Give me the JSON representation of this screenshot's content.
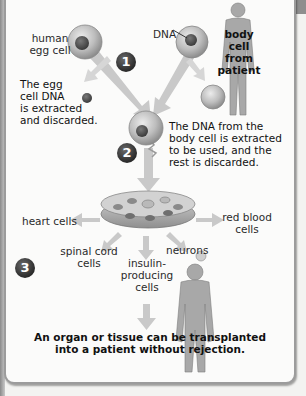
{
  "labels": {
    "human_egg_cell": [
      "human",
      "egg cell"
    ],
    "dna": "DNA",
    "body_cell": [
      "body cell",
      "from",
      "patient"
    ],
    "egg_dna_discarded": [
      "The egg",
      "cell DNA",
      "is extracted",
      "and discarded."
    ],
    "body_dna_extracted": [
      "The DNA from the",
      "body cell is extracted",
      "to be used, and the",
      "rest is discarded."
    ],
    "heart_cells": "heart cells",
    "red_blood_cells": [
      "red blood",
      "cells"
    ],
    "spinal_cord_cells": [
      "spinal cord",
      "cells"
    ],
    "insulin_cells": [
      "insulin-",
      "producing",
      "cells"
    ],
    "neurons": "neurons",
    "conclusion": [
      "An organ or tissue can be transplanted",
      "into a patient without rejection."
    ]
  },
  "steps": [
    "1",
    "2",
    "3"
  ],
  "colors": {
    "cell_fill": "#b9b9b9",
    "nucleus": "#555555",
    "arrow": "#c7c7c7",
    "human_silhouette": "#a9a9a9",
    "step_badge": "#333333"
  }
}
